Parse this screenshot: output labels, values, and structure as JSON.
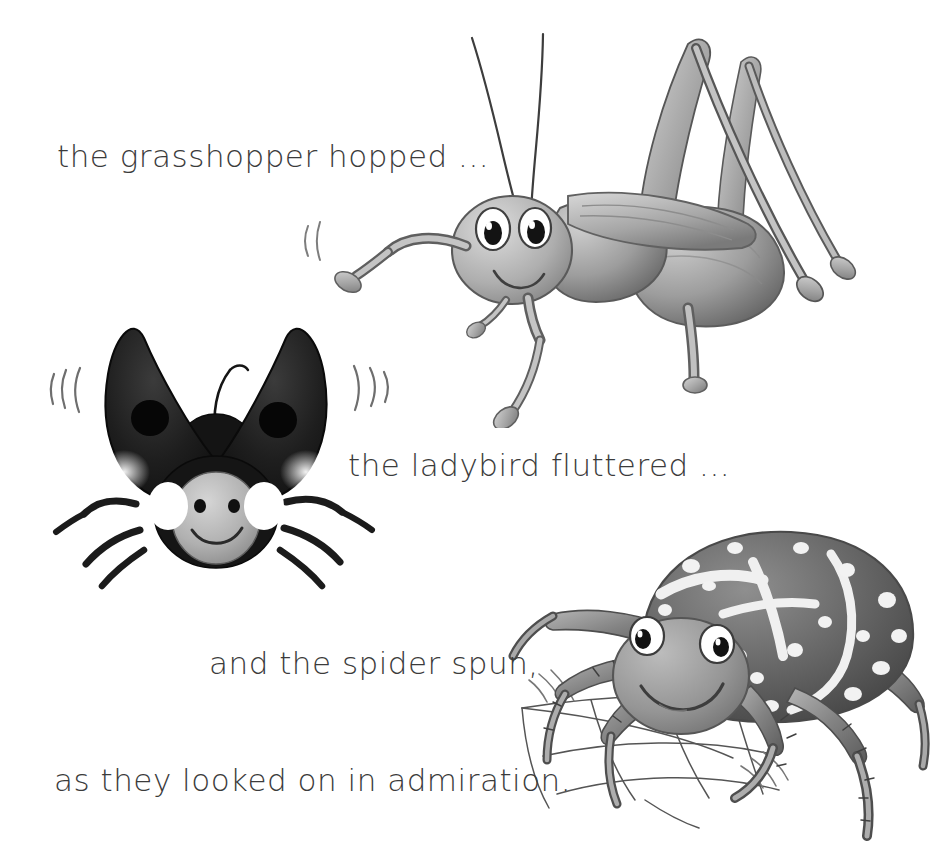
{
  "page": {
    "background_color": "#ffffff",
    "text_color": "#3b3b3b",
    "width": 934,
    "height": 867,
    "kind": "storybook-illustration-page"
  },
  "story": {
    "lines": [
      {
        "id": "grasshopper",
        "text": "the grasshopper hopped ..."
      },
      {
        "id": "ladybird",
        "text": "the ladybird fluttered ..."
      },
      {
        "id": "spider",
        "text": "and the spider spun,"
      },
      {
        "id": "admiration",
        "text": "as they looked on in admiration."
      }
    ]
  },
  "illustrations": [
    {
      "id": "grasshopper",
      "name": "grasshopper-illustration",
      "subject": "grasshopper",
      "style": "pencil-shaded greyscale cartoon",
      "features": [
        "two long curved antennae",
        "large round eyes with black pupils",
        "smiling mouth",
        "folded wing over body",
        "two tall inverted-V hind legs",
        "four slender walking legs",
        "motion arcs at front leg"
      ],
      "colors": {
        "body_light": "#c9c9c9",
        "body_mid": "#9a9a9a",
        "body_dark": "#6e6e6e",
        "outline": "#4a4a4a"
      }
    },
    {
      "id": "ladybird",
      "name": "ladybird-illustration",
      "subject": "ladybird",
      "style": "pencil-shaded greyscale cartoon",
      "features": [
        "two open dark elytra raised like wings",
        "two large black spots",
        "white oval cheek patches",
        "grey face with two eyes and a smile",
        "single curved antenna",
        "six dark legs",
        "flutter motion strokes on both sides"
      ],
      "colors": {
        "elytra": "#1a1a1a",
        "elytra_shade": "#3a3a3a",
        "face": "#b8b8b8",
        "cheek": "#ffffff",
        "outline": "#222222"
      }
    },
    {
      "id": "spider",
      "name": "spider-illustration",
      "subject": "spider",
      "style": "pencil-shaded greyscale cartoon",
      "features": [
        "large mottled abdomen with white spots and bands",
        "round grey head with two big eyes",
        "smiling mouth",
        "eight hairy bristled legs",
        "partial spider web strands below"
      ],
      "colors": {
        "abdomen_dark": "#555555",
        "abdomen_mid": "#7d7d7d",
        "markings": "#f2f2f2",
        "head": "#9f9f9f",
        "web_line": "#4f4f4f"
      }
    }
  ]
}
